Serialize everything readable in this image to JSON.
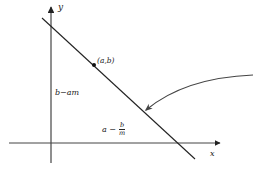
{
  "diagram": {
    "type": "coordinate-line-diagram",
    "axes": {
      "x_label": "x",
      "y_label": "y"
    },
    "point": {
      "label": "(a,b)"
    },
    "y_intercept_label": "b−am",
    "x_intercept_label": {
      "left": "a −",
      "numerator": "b",
      "denominator": "m"
    },
    "colors": {
      "stroke": "#222222",
      "arrow": "#444444",
      "background": "#ffffff"
    }
  }
}
